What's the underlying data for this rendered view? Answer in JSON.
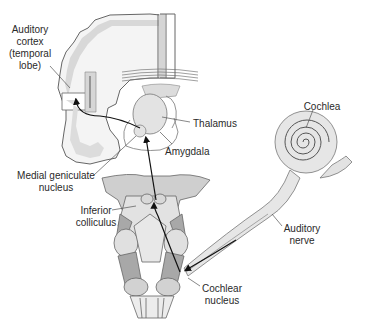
{
  "labels": {
    "auditory_cortex": [
      "Auditory",
      "cortex",
      "(temporal",
      "lobe)"
    ],
    "thalamus": "Thalamus",
    "amygdala": "Amygdala",
    "medial_geniculate": [
      "Medial geniculate",
      "nucleus"
    ],
    "inferior_colliculus": [
      "Inferior",
      "colliculus"
    ],
    "cochlea": "Cochlea",
    "auditory_nerve": [
      "Auditory",
      "nerve"
    ],
    "cochlear_nucleus": [
      "Cochlear",
      "nucleus"
    ]
  },
  "colors": {
    "outline": "#555555",
    "fill_light": "#e6e6e6",
    "fill_mid": "#cfcfcf",
    "fill_dark": "#a9a9a9",
    "pathway": "#111111"
  }
}
